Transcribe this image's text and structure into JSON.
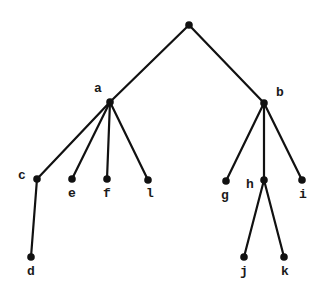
{
  "diagram": {
    "type": "tree",
    "background": "#ffffff",
    "ink_color": "#111111",
    "nodes": [
      {
        "id": "root",
        "label": "",
        "x": 189,
        "y": 25,
        "lx": 0,
        "ly": 0
      },
      {
        "id": "a",
        "label": "a",
        "x": 110,
        "y": 102,
        "lx": 98,
        "ly": 89
      },
      {
        "id": "b",
        "label": "b",
        "x": 264,
        "y": 103,
        "lx": 280,
        "ly": 93
      },
      {
        "id": "c",
        "label": "c",
        "x": 37,
        "y": 179,
        "lx": 22,
        "ly": 176
      },
      {
        "id": "d",
        "label": "d",
        "x": 31,
        "y": 257,
        "lx": 31,
        "ly": 272
      },
      {
        "id": "e",
        "label": "e",
        "x": 72,
        "y": 179,
        "lx": 72,
        "ly": 194
      },
      {
        "id": "f",
        "label": "f",
        "x": 107,
        "y": 179,
        "lx": 107,
        "ly": 194
      },
      {
        "id": "l",
        "label": "l",
        "x": 148,
        "y": 180,
        "lx": 150,
        "ly": 194
      },
      {
        "id": "g",
        "label": "g",
        "x": 226,
        "y": 181,
        "lx": 225,
        "ly": 196
      },
      {
        "id": "h",
        "label": "h",
        "x": 264,
        "y": 180,
        "lx": 250,
        "ly": 185
      },
      {
        "id": "i",
        "label": "i",
        "x": 302,
        "y": 180,
        "lx": 303,
        "ly": 195
      },
      {
        "id": "j",
        "label": "j",
        "x": 244,
        "y": 257,
        "lx": 244,
        "ly": 272
      },
      {
        "id": "k",
        "label": "k",
        "x": 284,
        "y": 257,
        "lx": 285,
        "ly": 272
      }
    ],
    "edges": [
      {
        "from": "root",
        "to": "a"
      },
      {
        "from": "root",
        "to": "b"
      },
      {
        "from": "a",
        "to": "c"
      },
      {
        "from": "a",
        "to": "e"
      },
      {
        "from": "a",
        "to": "f"
      },
      {
        "from": "a",
        "to": "l"
      },
      {
        "from": "c",
        "to": "d"
      },
      {
        "from": "b",
        "to": "g"
      },
      {
        "from": "b",
        "to": "h"
      },
      {
        "from": "b",
        "to": "i"
      },
      {
        "from": "h",
        "to": "j"
      },
      {
        "from": "h",
        "to": "k"
      }
    ]
  }
}
